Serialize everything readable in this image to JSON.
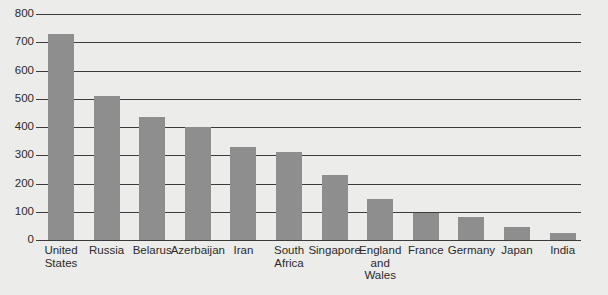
{
  "chart_data": {
    "type": "bar",
    "title": "",
    "xlabel": "",
    "ylabel": "",
    "ylim": [
      0,
      800
    ],
    "ytick_labels": [
      "800",
      "700",
      "600",
      "500",
      "400",
      "300",
      "200",
      "100",
      "0"
    ],
    "yticks": [
      800,
      700,
      600,
      500,
      400,
      300,
      200,
      100,
      0
    ],
    "grid": true,
    "legend": "none",
    "bar_color": "#8e8e8e",
    "background_color": "#ececea",
    "axis_color": "#3c3c3c",
    "categories": [
      "United\nStates",
      "Russia",
      "Belarus",
      "Azerbaijan",
      "Iran",
      "South\nAfrica",
      "Singapore",
      "England\nand\nWales",
      "France",
      "Germany",
      "Japan",
      "India"
    ],
    "values": [
      730,
      510,
      435,
      400,
      330,
      310,
      230,
      145,
      95,
      80,
      45,
      25
    ]
  }
}
